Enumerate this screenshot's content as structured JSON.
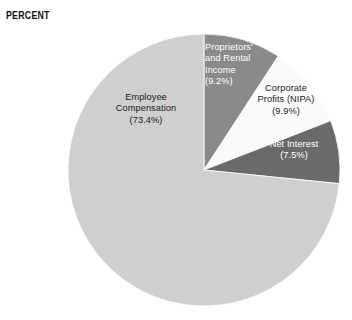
{
  "axis": {
    "title": "PERCENT"
  },
  "chart_data": {
    "type": "pie",
    "title": "PERCENT",
    "xlabel": "",
    "ylabel": "PERCENT",
    "grid": false,
    "legend_position": "none",
    "labels_inside_slices": true,
    "start_angle_deg": 0,
    "direction": "clockwise",
    "categories": [
      "Proprietors' and Rental Income",
      "Corporate Profits (NIPA)",
      "Net Interest",
      "Employee Compensation"
    ],
    "values": [
      9.2,
      9.9,
      7.5,
      73.4
    ],
    "units": "percent",
    "colors": [
      "#8a8a8a",
      "#fafafa",
      "#6a6a6a",
      "#cfcfcf"
    ],
    "slices": [
      {
        "name": "Proprietors' and Rental Income",
        "value": 9.2,
        "value_label": "(9.2%)",
        "label_text": "Proprietors'\nand Rental\nIncome\n(9.2%)",
        "color": "#8a8a8a",
        "text_color": "#ffffff"
      },
      {
        "name": "Corporate Profits (NIPA)",
        "value": 9.9,
        "value_label": "(9.9%)",
        "label_text": "Corporate\nProfits (NIPA)\n(9.9%)",
        "color": "#fafafa",
        "text_color": "#1b1b1b"
      },
      {
        "name": "Net Interest",
        "value": 7.5,
        "value_label": "(7.5%)",
        "label_text": "Net Interest\n(7.5%)",
        "color": "#6a6a6a",
        "text_color": "#ffffff"
      },
      {
        "name": "Employee Compensation",
        "value": 73.4,
        "value_label": "(73.4%)",
        "label_text": "Employee\nCompensation\n(73.4%)",
        "color": "#cfcfcf",
        "text_color": "#1b1b1b"
      }
    ]
  },
  "geometry": {
    "center_x": 204,
    "center_y": 170,
    "radius": 136
  }
}
